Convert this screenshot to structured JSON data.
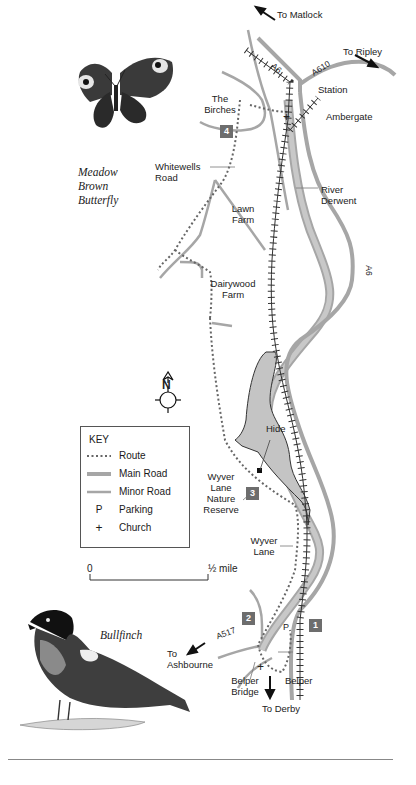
{
  "map": {
    "destinations": {
      "matlock": "To Matlock",
      "ripley": "To Ripley",
      "ashbourne": "To Ashbourne",
      "derby": "To Derby"
    },
    "road_labels": {
      "a6_north": "A6",
      "a610": "A610",
      "a6_east": "A6",
      "a517": "A517"
    },
    "places": {
      "station": "Station",
      "ambergate": "Ambergate",
      "the_birches": "The Birches",
      "whitewells_road": "Whitewells Road",
      "river_derwent": "River Derwent",
      "lawn_farm": "Lawn Farm",
      "dairywood_farm": "Dairywood Farm",
      "hide": "Hide",
      "wyver_lane_nature_reserve": "Wyver Lane Nature Reserve",
      "wyver_lane": "Wyver Lane",
      "belper_bridge": "Belper Bridge",
      "belper": "Belper",
      "parking_marker": "P",
      "church_marker": "+"
    },
    "waypoints": [
      "1",
      "2",
      "3",
      "4"
    ],
    "compass": {
      "label": "N"
    },
    "scale": {
      "start": "0",
      "end": "½ mile"
    }
  },
  "key": {
    "title": "KEY",
    "items": [
      {
        "symbol": "dotted-line",
        "label": "Route"
      },
      {
        "symbol": "thick-grey-line",
        "label": "Main Road"
      },
      {
        "symbol": "thin-grey-line",
        "label": "Minor Road"
      },
      {
        "symbol": "P",
        "label": "Parking"
      },
      {
        "symbol": "+",
        "label": "Church"
      }
    ]
  },
  "illustrations": {
    "butterfly_caption": [
      "Meadow",
      "Brown",
      "Butterfly"
    ],
    "bird_caption": "Bullfinch"
  },
  "colors": {
    "road": "#a6a6a6",
    "river_fill": "#bdbdbd",
    "reserve_fill": "#c4c4c4",
    "badge": "#6d6d6d",
    "ink": "#1a1a1a"
  }
}
